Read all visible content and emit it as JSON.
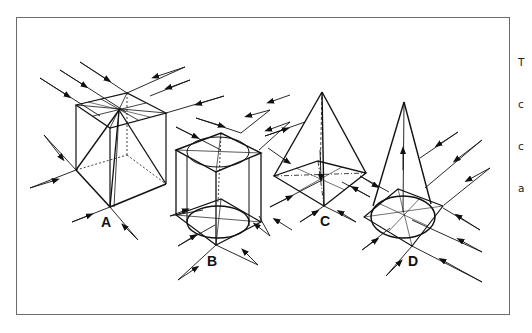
{
  "figure": {
    "shapes": [
      {
        "id": "A",
        "label": "A",
        "description": "cube with inscribed pyramid"
      },
      {
        "id": "B",
        "label": "B",
        "description": "cube with inscribed cylinder"
      },
      {
        "id": "C",
        "label": "C",
        "description": "square pyramid"
      },
      {
        "id": "D",
        "label": "D",
        "description": "cone on square base"
      }
    ],
    "colors": {
      "stroke": "#111111",
      "frame": "#6b6b6b",
      "background": "#ffffff"
    }
  },
  "side_text": {
    "lines": [
      "T",
      "c",
      "c",
      "a"
    ]
  }
}
